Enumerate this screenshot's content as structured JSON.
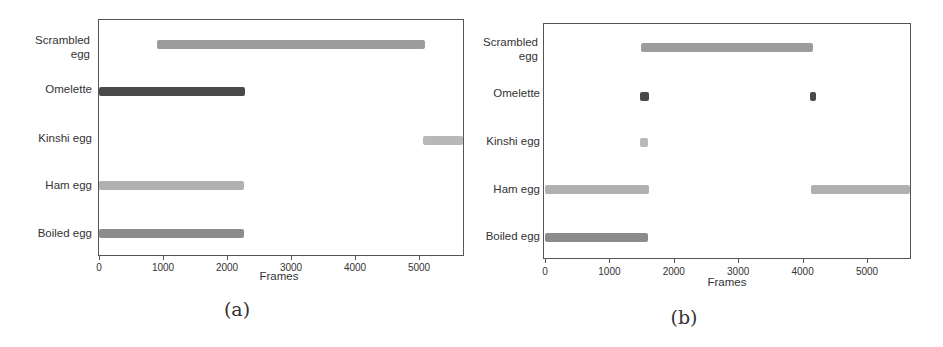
{
  "colors": {
    "Scrambled egg": "#9c9c9c",
    "Omelette": "#4a4a4a",
    "Kinshi egg": "#b8b8b8",
    "Ham egg": "#b0b0b0",
    "Boiled egg": "#8c8c8c"
  },
  "chart_data": [
    {
      "type": "bar",
      "subtype": "timeline-range",
      "title": "",
      "caption": "(a)",
      "xlabel": "Frames",
      "ylabel": "",
      "xlim": [
        0,
        5680
      ],
      "xticks": [
        0,
        1000,
        2000,
        3000,
        4000,
        5000
      ],
      "categories": [
        "Scrambled egg",
        "Omelette",
        "Kinshi egg",
        "Ham egg",
        "Boiled egg"
      ],
      "series": [
        {
          "name": "Scrambled egg",
          "segments": [
            [
              900,
              5090
            ]
          ]
        },
        {
          "name": "Omelette",
          "segments": [
            [
              0,
              2280
            ]
          ]
        },
        {
          "name": "Kinshi egg",
          "segments": [
            [
              5060,
              5680
            ]
          ]
        },
        {
          "name": "Ham egg",
          "segments": [
            [
              0,
              2270
            ]
          ]
        },
        {
          "name": "Boiled egg",
          "segments": [
            [
              0,
              2270
            ]
          ]
        }
      ],
      "grid": false,
      "legend": "none"
    },
    {
      "type": "bar",
      "subtype": "timeline-range",
      "title": "",
      "caption": "(b)",
      "xlabel": "Frames",
      "ylabel": "",
      "xlim": [
        0,
        5670
      ],
      "xticks": [
        0,
        1000,
        2000,
        3000,
        4000,
        5000
      ],
      "categories": [
        "Scrambled egg",
        "Omelette",
        "Kinshi egg",
        "Ham egg",
        "Boiled egg"
      ],
      "series": [
        {
          "name": "Scrambled egg",
          "segments": [
            [
              1490,
              4160
            ]
          ]
        },
        {
          "name": "Omelette",
          "segments": [
            [
              1480,
              1610
            ],
            [
              4110,
              4210
            ]
          ]
        },
        {
          "name": "Kinshi egg",
          "segments": [
            [
              1480,
              1600
            ]
          ]
        },
        {
          "name": "Ham egg",
          "segments": [
            [
              0,
              1610
            ],
            [
              4130,
              5670
            ]
          ]
        },
        {
          "name": "Boiled egg",
          "segments": [
            [
              0,
              1600
            ]
          ]
        }
      ],
      "grid": false,
      "legend": "none"
    }
  ],
  "panels": [
    {
      "caption": "(a)",
      "xlabel": "Frames",
      "ylabels": [
        "Scrambled\negg",
        "Omelette",
        "Kinshi egg",
        "Ham egg",
        "Boiled egg"
      ],
      "ticks": [
        "0",
        "1000",
        "2000",
        "3000",
        "4000",
        "5000"
      ]
    },
    {
      "caption": "(b)",
      "xlabel": "Frames",
      "ylabels": [
        "Scrambled\negg",
        "Omelette",
        "Kinshi egg",
        "Ham egg",
        "Boiled egg"
      ],
      "ticks": [
        "0",
        "1000",
        "2000",
        "3000",
        "4000",
        "5000"
      ]
    }
  ]
}
